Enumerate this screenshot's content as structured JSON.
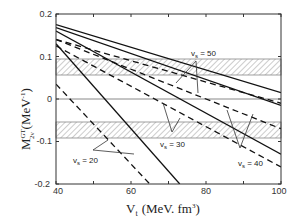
{
  "chart_data": {
    "type": "line",
    "title": "",
    "xlabel": "V_t (MeV. fm^3)",
    "ylabel": "M_{2ν}^{GT} (MeV^-1)",
    "xlim": [
      40,
      100
    ],
    "ylim": [
      -0.2,
      0.2
    ],
    "x_ticks": [
      "40",
      "60",
      "80",
      "100"
    ],
    "y_ticks": [
      "0.2",
      "0.1",
      "0",
      "-0.1",
      "-0.2"
    ],
    "grid": false,
    "bands": [
      {
        "name": "upper hatched band",
        "y_range": [
          0.057,
          0.095
        ]
      },
      {
        "name": "lower hatched band",
        "y_range": [
          -0.093,
          -0.055
        ]
      }
    ],
    "series": [
      {
        "name": "v_s = 50 (solid)",
        "style": "solid",
        "x": [
          40,
          100
        ],
        "values": [
          0.175,
          0.015
        ]
      },
      {
        "name": "v_s = 50 (dashed)",
        "style": "dashed",
        "x": [
          40,
          100
        ],
        "values": [
          0.14,
          -0.01
        ]
      },
      {
        "name": "v_s = 40 (solid)",
        "style": "solid",
        "x": [
          40,
          100
        ],
        "values": [
          0.168,
          -0.015
        ]
      },
      {
        "name": "v_s = 40 (dashed)",
        "style": "dashed",
        "x": [
          40,
          100
        ],
        "values": [
          0.14,
          -0.07
        ]
      },
      {
        "name": "v_s = 30 (solid)",
        "style": "solid",
        "x": [
          40,
          100
        ],
        "values": [
          0.16,
          -0.13
        ]
      },
      {
        "name": "v_s = 30 (dashed)",
        "style": "dashed",
        "x": [
          40,
          100
        ],
        "values": [
          0.125,
          -0.16
        ]
      },
      {
        "name": "v_s = 20 (solid)",
        "style": "solid",
        "x": [
          40,
          73
        ],
        "values": [
          0.13,
          -0.2
        ]
      },
      {
        "name": "v_s = 20 (dashed)",
        "style": "dashed",
        "x": [
          40,
          65
        ],
        "values": [
          0.035,
          -0.2
        ]
      }
    ],
    "annotations": [
      "v_s = 50",
      "v_s = 40",
      "v_s = 30",
      "v_s = 20"
    ]
  },
  "labels": {
    "vs50": "v",
    "vs50_sub": "s",
    "vs50_val": " = 50",
    "vs40": "v",
    "vs40_sub": "s",
    "vs40_val": " = 40",
    "vs30": "v",
    "vs30_sub": "s",
    "vs30_val": " = 30",
    "vs20": "v",
    "vs20_sub": "s",
    "vs20_val": " = 20",
    "ylabel_main": "M",
    "ylabel_sup": "GT",
    "ylabel_sub": "2ν",
    "ylabel_unit": "(MeV",
    "ylabel_unit_sup": "-1",
    "ylabel_close": ")",
    "xlabel_main": "V",
    "xlabel_sub": "t",
    "xlabel_unit": "(MeV. fm",
    "xlabel_unit_sup": "3",
    "xlabel_close": ")"
  },
  "ticks": {
    "x": [
      "40",
      "60",
      "80",
      "100"
    ],
    "y": [
      "0.2",
      "0.1",
      "0",
      "-0.1",
      "-0.2"
    ]
  }
}
